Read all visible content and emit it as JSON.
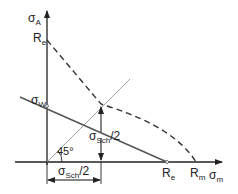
{
  "diagram": {
    "type": "Haigh fatigue diagram",
    "labels": {
      "y_axis": {
        "main": "σ",
        "sub": "A"
      },
      "x_axis": {
        "main": "σ",
        "sub": "m"
      },
      "re_top": {
        "main": "R",
        "sub": "e"
      },
      "sigma_w": {
        "main": "σ",
        "sub": "W"
      },
      "re_bottom": {
        "main": "R",
        "sub": "e"
      },
      "rm": {
        "main": "R",
        "sub": "m"
      },
      "angle": "45°",
      "vertical_dim": {
        "main": "σ",
        "sub": "Sch",
        "suffix": "/2"
      },
      "horizontal_dim": {
        "main": "σ",
        "sub": "Sch",
        "suffix": "/2"
      }
    },
    "colors": {
      "axis": "#222222",
      "solid_line": "#555555",
      "dashed_line": "#333333",
      "diagonal": "#888888"
    }
  }
}
